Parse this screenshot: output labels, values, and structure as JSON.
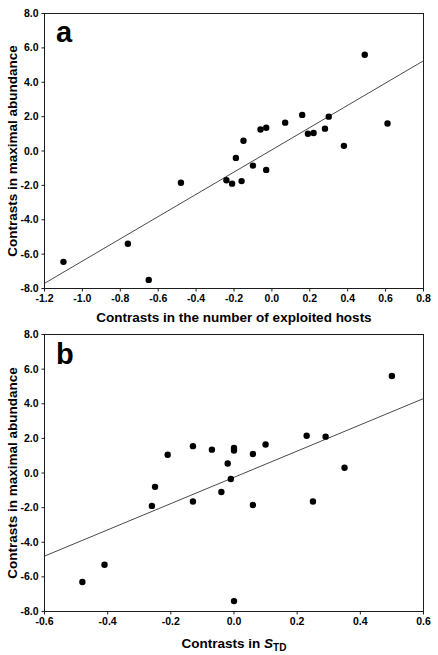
{
  "figure": {
    "background": "#ffffff",
    "frame_color": "#1c1c1c",
    "point_color": "#000000",
    "regression_line_color": "#4a4a4a",
    "text_color": "#000000"
  },
  "chart_data": [
    {
      "type": "scatter",
      "panel_label": "a",
      "xlabel": "Contrasts in the number of exploited hosts",
      "ylabel": "Contrasts in maximal abundance",
      "xlim": [
        -1.2,
        0.8
      ],
      "xticks": [
        -1.2,
        -1.0,
        -0.8,
        -0.6,
        -0.4,
        -0.2,
        0.0,
        0.2,
        0.4,
        0.6,
        0.8
      ],
      "ylim": [
        -8.0,
        8.0
      ],
      "yticks": [
        8.0,
        6.0,
        4.0,
        2.0,
        0.0,
        -2.0,
        -4.0,
        -6.0,
        -8.0
      ],
      "grid": false,
      "regression_line": {
        "x1": -1.2,
        "y1": -7.7,
        "x2": 0.8,
        "y2": 5.25
      },
      "points": [
        [
          -1.1,
          -6.45
        ],
        [
          -0.76,
          -5.4
        ],
        [
          -0.65,
          -7.5
        ],
        [
          -0.48,
          -1.85
        ],
        [
          -0.24,
          -1.7
        ],
        [
          -0.21,
          -1.9
        ],
        [
          -0.16,
          -1.75
        ],
        [
          -0.19,
          -0.4
        ],
        [
          -0.15,
          0.6
        ],
        [
          -0.1,
          -0.85
        ],
        [
          -0.06,
          1.25
        ],
        [
          -0.03,
          1.35
        ],
        [
          -0.03,
          -1.1
        ],
        [
          0.07,
          1.65
        ],
        [
          0.16,
          2.1
        ],
        [
          0.19,
          1.0
        ],
        [
          0.22,
          1.05
        ],
        [
          0.28,
          1.3
        ],
        [
          0.3,
          2.0
        ],
        [
          0.38,
          0.3
        ],
        [
          0.49,
          5.6
        ],
        [
          0.61,
          1.6
        ]
      ]
    },
    {
      "type": "scatter",
      "panel_label": "b",
      "xlabel_prefix": "Contrasts in ",
      "xlabel_var": "S",
      "xlabel_sub": "TD",
      "ylabel": "Contrasts in maximal abundance",
      "xlim": [
        -0.6,
        0.6
      ],
      "xticks": [
        -0.6,
        -0.4,
        -0.2,
        0.0,
        0.2,
        0.4,
        0.6
      ],
      "ylim": [
        -8.0,
        8.0
      ],
      "yticks": [
        8.0,
        6.0,
        4.0,
        2.0,
        0.0,
        -2.0,
        -4.0,
        -6.0,
        -8.0
      ],
      "grid": false,
      "regression_line": {
        "x1": -0.6,
        "y1": -4.8,
        "x2": 0.6,
        "y2": 4.3
      },
      "points": [
        [
          -0.48,
          -6.3
        ],
        [
          -0.41,
          -5.3
        ],
        [
          -0.26,
          -1.9
        ],
        [
          -0.25,
          -0.8
        ],
        [
          -0.21,
          1.05
        ],
        [
          -0.13,
          1.55
        ],
        [
          -0.13,
          -1.65
        ],
        [
          -0.07,
          1.35
        ],
        [
          -0.04,
          -1.1
        ],
        [
          -0.02,
          0.55
        ],
        [
          -0.01,
          -0.35
        ],
        [
          0.0,
          1.45
        ],
        [
          0.0,
          1.3
        ],
        [
          0.0,
          -7.4
        ],
        [
          0.06,
          1.1
        ],
        [
          0.06,
          -1.85
        ],
        [
          0.1,
          1.65
        ],
        [
          0.23,
          2.15
        ],
        [
          0.25,
          -1.65
        ],
        [
          0.29,
          2.1
        ],
        [
          0.35,
          0.3
        ],
        [
          0.5,
          5.6
        ]
      ]
    }
  ]
}
